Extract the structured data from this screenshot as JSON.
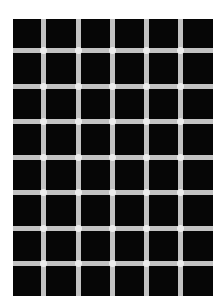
{
  "figure": {
    "title": "",
    "columns": 6,
    "rows": 8,
    "colors": {
      "background": "#ffffff",
      "squares": "#060606",
      "lines": "#c2c2c2",
      "intersections": "#ececec"
    },
    "grid_box": {
      "left": 13,
      "top": 19,
      "width": 200,
      "height": 277
    },
    "vertical_lines_x": [
      28,
      63,
      97,
      131,
      165
    ],
    "horizontal_lines_y": [
      29,
      65,
      100,
      136,
      171,
      207,
      242
    ]
  }
}
